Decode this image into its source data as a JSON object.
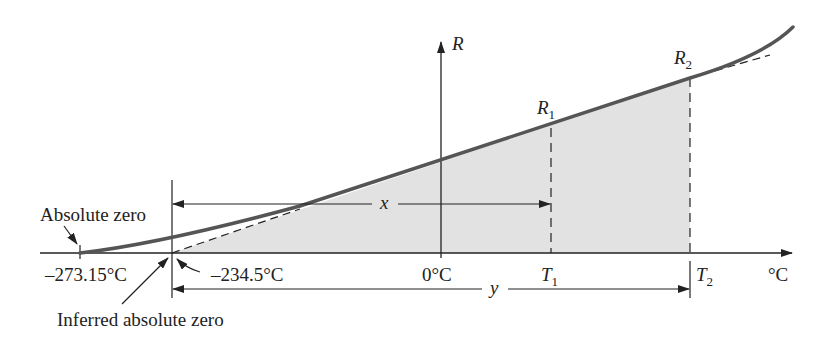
{
  "diagram": {
    "y_axis_label": "R",
    "x_axis_unit": "°C",
    "labels": {
      "absolute_zero": "Absolute zero",
      "absolute_zero_value": "–273.15°C",
      "inferred_zero_value": "–234.5°C",
      "inferred_absolute_zero": "Inferred absolute zero",
      "zero_c": "0°C",
      "t1": "T",
      "t1_sub": "1",
      "t2": "T",
      "t2_sub": "2",
      "r1": "R",
      "r1_sub": "1",
      "r2": "R",
      "r2_sub": "2",
      "x_dim": "x",
      "y_dim": "y"
    },
    "colors": {
      "curve": "#555555",
      "shade": "#e2e2e2",
      "line": "#222222"
    }
  }
}
